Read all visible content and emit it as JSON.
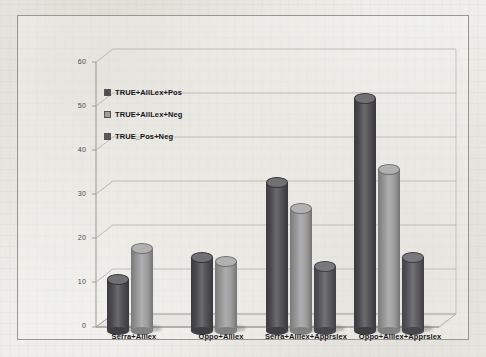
{
  "chart_data": {
    "type": "bar",
    "title": "",
    "subtitle": "",
    "xlabel": "",
    "ylabel": "",
    "ylim": [
      0,
      60
    ],
    "ytick_step": 10,
    "yticks": [
      "0",
      "10",
      "20",
      "30",
      "40",
      "50",
      "60"
    ],
    "grid": true,
    "style": "3d-cylinder-clustered",
    "legend_position": "inside-upper-left",
    "categories": [
      "Serra+Alllex",
      "Oppo+Alllex",
      "Serra+Alllex+Apprslex",
      "Oppo+Alllex+Apprslex"
    ],
    "series": [
      {
        "name": "TRUE+AllLex+Pos",
        "color": "#4d4d52",
        "values": [
          12,
          17,
          34,
          53
        ]
      },
      {
        "name": "TRUE+AllLex+Neg",
        "color": "#9d9d9d",
        "values": [
          19,
          16,
          28,
          37
        ]
      },
      {
        "name": "TRUE_Pos+Neg",
        "color": "#57575c",
        "values": [
          null,
          null,
          15,
          17
        ]
      }
    ]
  },
  "legend": {
    "items": [
      {
        "label": "TRUE+AllLex+Pos",
        "color": "#4d4d52"
      },
      {
        "label": "TRUE+AllLex+Neg",
        "color": "#9d9d9d"
      },
      {
        "label": "TRUE_Pos+Neg",
        "color": "#57575c"
      }
    ]
  },
  "colors": {
    "frame_border": "#9a978f",
    "gridline": "#b9b6ae",
    "axis_line": "#8f8c85",
    "floor": "#e7e5e0",
    "background": "#efeeea",
    "tick_text": "#4a4a4a",
    "category_text": "#17171a"
  }
}
